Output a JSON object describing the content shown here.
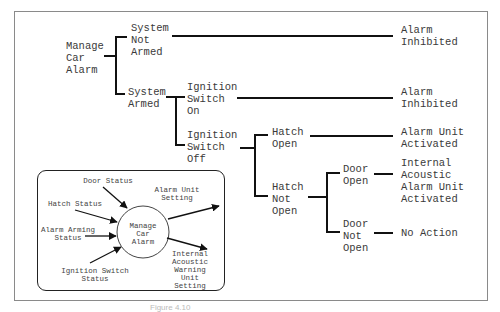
{
  "tree": {
    "root": [
      "Manage",
      "Car",
      "Alarm"
    ],
    "system_not_armed": [
      "System",
      "Not",
      "Armed"
    ],
    "system_armed": [
      "System",
      "Armed"
    ],
    "ignition_on": [
      "Ignition",
      "Switch",
      "On"
    ],
    "ignition_off": [
      "Ignition",
      "Switch",
      "Off"
    ],
    "hatch_open": [
      "Hatch",
      "Open"
    ],
    "hatch_not_open": [
      "Hatch",
      "Not",
      "Open"
    ],
    "door_open": [
      "Door",
      "Open"
    ],
    "door_not_open": [
      "Door",
      "Not",
      "Open"
    ],
    "outcomes": {
      "alarm_inhibited_1": [
        "Alarm",
        "Inhibited"
      ],
      "alarm_inhibited_2": [
        "Alarm",
        "Inhibited"
      ],
      "alarm_unit_activated": [
        "Alarm Unit",
        "Activated"
      ],
      "internal_acoustic": [
        "Internal",
        "Acoustic",
        "Alarm Unit",
        "Activated"
      ],
      "no_action": [
        "No Action"
      ]
    }
  },
  "context_diagram": {
    "process": [
      "Manage",
      "Car",
      "Alarm"
    ],
    "inputs": {
      "door_status": "Door Status",
      "hatch_status": "Hatch Status",
      "alarm_arming_status": [
        "Alarm Arming",
        "Status"
      ],
      "ignition_switch_status": [
        "Ignition Switch",
        "Status"
      ]
    },
    "outputs": {
      "alarm_unit_setting": [
        "Alarm Unit",
        "Setting"
      ],
      "internal_warning_setting": [
        "Internal",
        "Acoustic",
        "Warning",
        "Unit",
        "Setting"
      ]
    }
  },
  "caption": "Figure 4.10"
}
